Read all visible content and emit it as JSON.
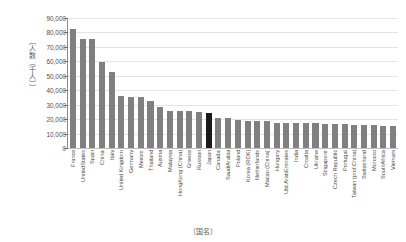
{
  "chart_data": {
    "type": "bar",
    "title": "",
    "subtitle": "",
    "xlabel": "〔国名〕",
    "ylabel": "〔人数（千人）〕",
    "ylim": [
      0,
      90000
    ],
    "ytick_step": 10000,
    "ytick_labels": [
      "90,000",
      "80,000",
      "70,000",
      "60,000",
      "50,000",
      "40,000",
      "30,000",
      "20,000",
      "10,000",
      "0"
    ],
    "ytick_values": [
      90000,
      80000,
      70000,
      60000,
      50000,
      40000,
      30000,
      20000,
      10000,
      0
    ],
    "grid": true,
    "legend": false,
    "legend_position": "none",
    "highlight_category": "Japan",
    "bar_color": "#808080",
    "highlight_color": "#1a1a1a",
    "gridline_color": "#e4e4e4",
    "axis_color": "#8a8a8a",
    "categories": [
      "France",
      "UnitedStates",
      "Spain",
      "China",
      "Italy",
      "United Kingdom",
      "Germany",
      "Mexico",
      "Thailand",
      "Austria",
      "Malaysia",
      "HongKong (China)",
      "Greece",
      "Russian",
      "Japan",
      "Canada",
      "SaudiArabia",
      "Poland",
      "Korea (ROK)",
      "Netherlands",
      "Macao (China)",
      "Hungary",
      "Utd.ArabEmirates",
      "India",
      "Croatia",
      "Ukraine",
      "Singapore",
      "Czech Republic",
      "Portugal",
      "Taiwan (prof.China)",
      "Switzerland",
      "Morocco",
      "SouthAfrica",
      "Vietnam"
    ],
    "values": [
      82700,
      75600,
      75600,
      59300,
      52400,
      35800,
      35600,
      35100,
      32600,
      28100,
      25800,
      25700,
      25800,
      24600,
      24000,
      21100,
      20700,
      19600,
      19000,
      18800,
      18400,
      17600,
      17500,
      17400,
      17400,
      17000,
      16700,
      16700,
      16400,
      16100,
      15900,
      15600,
      15000,
      15000
    ]
  }
}
